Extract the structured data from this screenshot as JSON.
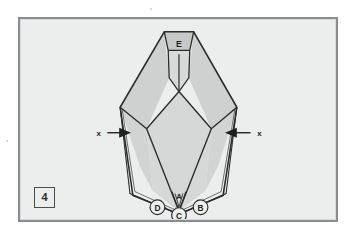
{
  "figure": {
    "number": "4",
    "background_color": "#eceded",
    "frame_color": "#8a8d8f",
    "line_color": "#2a2c2e",
    "fill_light": "#dcdddd",
    "fill_mid": "#d2d3d3",
    "fill_dark": "#c6c7c7"
  },
  "labels": {
    "apex_top": "E",
    "apex_bottom": "A",
    "callout_left": "D",
    "callout_center": "C",
    "callout_right": "B",
    "dimension_left": "x",
    "dimension_right": "x"
  },
  "annotations": {
    "leader_lines": [
      {
        "from": "D",
        "to": "left-lower-edge"
      },
      {
        "from": "C",
        "to": "center-lower-edge"
      },
      {
        "from": "B",
        "to": "right-lower-edge"
      }
    ],
    "arrows": [
      {
        "label": "x",
        "side": "left",
        "direction": "right"
      },
      {
        "label": "x",
        "side": "right",
        "direction": "left"
      }
    ]
  }
}
